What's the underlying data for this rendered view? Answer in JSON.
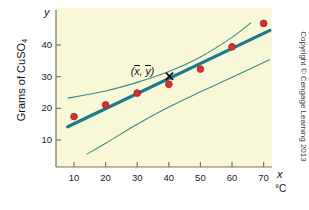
{
  "figure": {
    "background_color": "#ffffff",
    "panel_color": "#f8f7d8",
    "y_axis_variable": "y",
    "x_axis_variable": "x",
    "x_unit_label": "°C",
    "y_axis_title_main": "Grams of CuSO",
    "y_axis_title_sub": "4",
    "mean_annotation": "(",
    "mean_annotation_x": "x",
    "mean_annotation_mid": ", ",
    "mean_annotation_y": "y",
    "mean_annotation_end": ")",
    "mean_marker_glyph": "✕",
    "copyright": "Copyright © Cengage Learning 2013"
  },
  "colors": {
    "point_fill": "#d3302f",
    "point_stroke": "#a02020",
    "regression_line": "#1b7a8c",
    "band_line": "#3f8a86",
    "axis": "#6b6b4a",
    "text": "#111111"
  },
  "chart_data": {
    "type": "scatter",
    "title": "",
    "subtitle": "",
    "xlabel": "x",
    "ylabel": "Grams of CuSO4",
    "x_unit": "°C",
    "xlim": [
      0,
      76
    ],
    "ylim": [
      0,
      50
    ],
    "grid": false,
    "legend": null,
    "xticks": [
      10,
      20,
      30,
      40,
      50,
      60,
      70
    ],
    "xtick_labels": [
      "10",
      "20",
      "30",
      "40",
      "50",
      "60",
      "70"
    ],
    "yticks": [
      10,
      20,
      30,
      40
    ],
    "ytick_labels": [
      "10",
      "20",
      "30",
      "40"
    ],
    "series": [
      {
        "name": "Observed solubility",
        "type": "scatter",
        "marker": "circle",
        "color": "#d3302f",
        "x": [
          10,
          20,
          30,
          40,
          50,
          60,
          70
        ],
        "y": [
          17.4,
          21.1,
          24.8,
          27.6,
          32.4,
          39.4,
          46.8
        ]
      },
      {
        "name": "Least-squares regression line",
        "type": "line",
        "color": "#1b7a8c",
        "x": [
          8,
          72
        ],
        "y": [
          14.2,
          44.6
        ]
      },
      {
        "name": "Upper confidence band",
        "type": "curve",
        "color": "#3f8a86",
        "x": [
          8,
          20,
          30,
          40,
          50,
          60,
          66
        ],
        "y": [
          23.2,
          25.5,
          28.2,
          31.6,
          36.2,
          42.4,
          47.0
        ]
      },
      {
        "name": "Lower confidence band",
        "type": "curve",
        "color": "#3f8a86",
        "x": [
          14,
          20,
          30,
          40,
          50,
          60,
          72
        ],
        "y": [
          5.5,
          9.0,
          15.0,
          20.4,
          25.2,
          29.8,
          35.4
        ]
      }
    ],
    "annotations": [
      {
        "label": "(x̄, ȳ)",
        "x": 40,
        "y": 29.6,
        "marker": "✕",
        "description": "Point of means on the regression line"
      }
    ]
  }
}
